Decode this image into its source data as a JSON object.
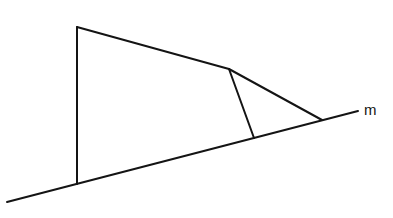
{
  "diagram": {
    "type": "geometry",
    "line_label": "m",
    "points": {
      "A": [
        77,
        27
      ],
      "B": [
        77,
        184
      ],
      "C": [
        229,
        69
      ],
      "D": [
        254,
        138
      ],
      "E": [
        322,
        120
      ]
    },
    "line_m": {
      "start": [
        7,
        202
      ],
      "end": [
        358,
        111
      ]
    },
    "segments": [
      [
        "A",
        "B"
      ],
      [
        "A",
        "C"
      ],
      [
        "C",
        "D"
      ],
      [
        "C",
        "E"
      ]
    ],
    "stroke_color": "#141414",
    "background": "#ffffff"
  }
}
